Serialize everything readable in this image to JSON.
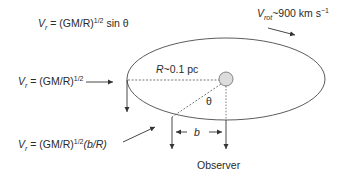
{
  "diagram": {
    "labels": {
      "vr_top": {
        "prefix": "V",
        "sub": "r",
        "mid": " = (GM/R)",
        "sup": "1/2",
        "suffix": " sin θ"
      },
      "vr_left": {
        "prefix": "V",
        "sub": "r",
        "mid": " = (GM/R)",
        "sup": "1/2",
        "suffix": ""
      },
      "vr_bottom": {
        "prefix": "V",
        "sub": "r",
        "mid": " = (GM/R)",
        "sup": "1/2",
        "suffix": "(b/R)"
      },
      "vrot": {
        "prefix": "V",
        "sub": "rot",
        "suffix": "~900 km s",
        "sup": "−1"
      },
      "radius": {
        "prefix": "R",
        "suffix": "~0.1 pc"
      },
      "theta": "θ",
      "b": "b",
      "observer": "Observer"
    },
    "colors": {
      "line": "#4a4a4a",
      "star_fill": "#dcdcdc",
      "star_stroke": "#777777",
      "text": "#2a2a2a"
    }
  }
}
